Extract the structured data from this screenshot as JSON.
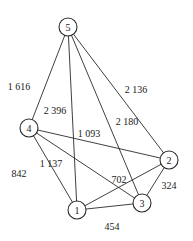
{
  "diagram": {
    "type": "weighted-undirected-graph",
    "nodes": [
      {
        "id": "1",
        "label": "1",
        "x": 77,
        "y": 210
      },
      {
        "id": "2",
        "label": "2",
        "x": 169,
        "y": 160
      },
      {
        "id": "3",
        "label": "3",
        "x": 142,
        "y": 203
      },
      {
        "id": "4",
        "label": "4",
        "x": 29,
        "y": 128
      },
      {
        "id": "5",
        "label": "5",
        "x": 68,
        "y": 27
      }
    ],
    "edges": [
      {
        "from": "5",
        "to": "4",
        "weight": "1 616",
        "label_x": 19,
        "label_y": 86
      },
      {
        "from": "5",
        "to": "1",
        "weight": "2 396",
        "label_x": 55,
        "label_y": 110
      },
      {
        "from": "5",
        "to": "3",
        "weight": "2 180",
        "label_x": 127,
        "label_y": 121
      },
      {
        "from": "5",
        "to": "2",
        "weight": "2 136",
        "label_x": 136,
        "label_y": 89
      },
      {
        "from": "4",
        "to": "2",
        "weight": "1 093",
        "label_x": 89,
        "label_y": 133
      },
      {
        "from": "4",
        "to": "1",
        "weight": "842",
        "label_x": 19,
        "label_y": 173
      },
      {
        "from": "4",
        "to": "3",
        "weight": "1 137",
        "label_x": 51,
        "label_y": 163
      },
      {
        "from": "1",
        "to": "2",
        "weight": "702",
        "label_x": 119,
        "label_y": 179
      },
      {
        "from": "2",
        "to": "3",
        "weight": "324",
        "label_x": 169,
        "label_y": 185
      },
      {
        "from": "1",
        "to": "3",
        "weight": "454",
        "label_x": 112,
        "label_y": 226
      }
    ]
  }
}
